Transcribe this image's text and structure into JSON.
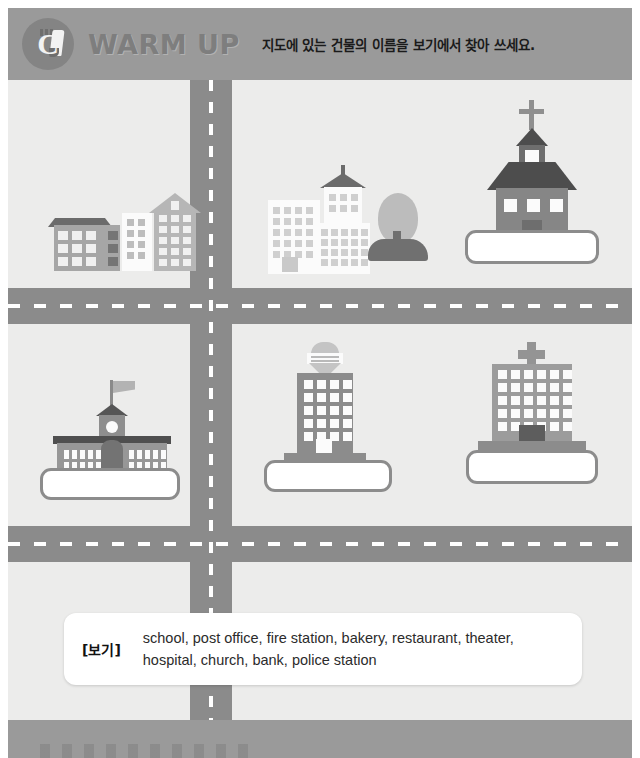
{
  "header": {
    "icon_name": "warm-up-badge-icon",
    "title": "WARM UP",
    "instruction": "지도에 있는 건물의 이름을 보기에서 찾아 쓰세요.",
    "banner_color": "#9a9a9a",
    "title_color": "#7e7e7e"
  },
  "map": {
    "background_color": "#ececeb",
    "road_color": "#8b8b8b",
    "lane_marking_color": "#ffffff",
    "roads": [
      {
        "name": "vertical-road",
        "orientation": "vertical"
      },
      {
        "name": "horizontal-road-upper",
        "orientation": "horizontal"
      },
      {
        "name": "horizontal-road-lower",
        "orientation": "horizontal"
      }
    ],
    "buildings": [
      {
        "name": "apartment-buildings-group",
        "label": "residential buildings",
        "cell": "top-left",
        "has_answer_box": false,
        "answer": ""
      },
      {
        "name": "office-buildings-group",
        "label": "office buildings with tree",
        "cell": "top-center",
        "has_answer_box": false,
        "answer": ""
      },
      {
        "name": "church-building",
        "label": "church",
        "cell": "top-right",
        "has_answer_box": true,
        "answer": ""
      },
      {
        "name": "school-building",
        "label": "school",
        "cell": "middle-left",
        "has_answer_box": true,
        "answer": ""
      },
      {
        "name": "tower-building",
        "label": "tall building with water tank",
        "cell": "middle-center",
        "has_answer_box": true,
        "answer": ""
      },
      {
        "name": "hospital-building",
        "label": "hospital",
        "cell": "middle-right",
        "has_answer_box": true,
        "answer": ""
      }
    ]
  },
  "wordbank": {
    "label": "[보기]",
    "words": "school, post office, fire station, bakery, restaurant, theater, hospital, church, bank, police station",
    "items": [
      "school",
      "post office",
      "fire station",
      "bakery",
      "restaurant",
      "theater",
      "hospital",
      "church",
      "bank",
      "police station"
    ]
  }
}
